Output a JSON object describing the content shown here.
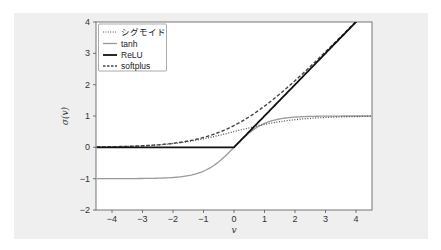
{
  "chart_data": {
    "type": "line",
    "title": "",
    "xlabel": "v",
    "ylabel": "σ(v)",
    "xlim": [
      -4.5,
      4.5
    ],
    "ylim": [
      -2,
      4
    ],
    "x_ticks": [
      "−4",
      "−3",
      "−2",
      "−1",
      "0",
      "1",
      "2",
      "3",
      "4"
    ],
    "y_ticks": [
      "4",
      "3",
      "2",
      "1",
      "0",
      "−1",
      "−2"
    ],
    "grid": false,
    "legend_position": "upper left",
    "x": [
      -4.5,
      -4,
      -3,
      -2,
      -1,
      0,
      1,
      2,
      3,
      4
    ],
    "series": [
      {
        "name": "シグモイド",
        "style": "dotted",
        "color": "#555555",
        "values": [
          0.011,
          0.018,
          0.047,
          0.119,
          0.269,
          0.5,
          0.731,
          0.881,
          0.953,
          0.982
        ]
      },
      {
        "name": "tanh",
        "style": "solid",
        "color": "#9a9a9a",
        "values": [
          -1.0,
          -0.999,
          -0.995,
          -0.964,
          -0.762,
          0.0,
          0.762,
          0.964,
          0.995,
          0.999
        ]
      },
      {
        "name": "ReLU",
        "style": "solid-thick",
        "color": "#111111",
        "values": [
          0,
          0,
          0,
          0,
          0,
          0,
          1,
          2,
          3,
          4
        ]
      },
      {
        "name": "softplus",
        "style": "dashed",
        "color": "#444444",
        "values": [
          0.011,
          0.018,
          0.049,
          0.127,
          0.313,
          0.693,
          1.313,
          2.127,
          3.049,
          4.018
        ]
      }
    ]
  },
  "legend": {
    "items": [
      "シグモイド",
      "tanh",
      "ReLU",
      "softplus"
    ]
  },
  "axes": {
    "xlabel": "v",
    "ylabel": "σ(v)",
    "x_ticks": [
      "−4",
      "−3",
      "−2",
      "−1",
      "0",
      "1",
      "2",
      "3",
      "4"
    ],
    "y_ticks": [
      "4",
      "3",
      "2",
      "1",
      "0",
      "−1",
      "−2"
    ]
  }
}
